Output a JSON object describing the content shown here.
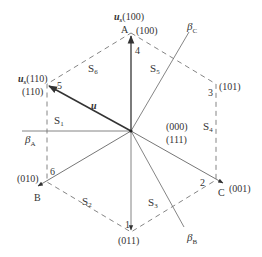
{
  "diagram": {
    "type": "space-vector-hexagon",
    "center": {
      "x": 131,
      "y": 131
    },
    "colors": {
      "line": "#555555",
      "dashed": "#777777",
      "vector": "#333333",
      "text": "#333333"
    },
    "vertices": [
      {
        "id": "v4",
        "number": "4",
        "code": "(100)",
        "axis": "A",
        "vector_label": "u",
        "vector_sub": "s",
        "vector_code": "(100)",
        "x": 131,
        "y": 33
      },
      {
        "id": "v5",
        "number": "5",
        "code": "(110)",
        "vector_label": "u",
        "vector_sub": "s",
        "vector_code": "(110)",
        "x": 47,
        "y": 84
      },
      {
        "id": "v6",
        "number": "6",
        "code": "(010)",
        "axis": "B",
        "x": 47,
        "y": 182
      },
      {
        "id": "v1",
        "number": "1",
        "code": "(011)",
        "x": 131,
        "y": 232
      },
      {
        "id": "v2",
        "number": "2",
        "code": "(001)",
        "axis": "C",
        "x": 216,
        "y": 180
      },
      {
        "id": "v3",
        "number": "3",
        "code": "(101)",
        "x": 216,
        "y": 84
      }
    ],
    "sectors": [
      {
        "label": "S",
        "sub": "1"
      },
      {
        "label": "S",
        "sub": "2"
      },
      {
        "label": "S",
        "sub": "3"
      },
      {
        "label": "S",
        "sub": "4"
      },
      {
        "label": "S",
        "sub": "5"
      },
      {
        "label": "S",
        "sub": "6"
      }
    ],
    "zero_vectors": [
      "(000)",
      "(111)"
    ],
    "beta_axes": [
      {
        "name": "β",
        "sub": "A"
      },
      {
        "name": "β",
        "sub": "B"
      },
      {
        "name": "β",
        "sub": "C"
      }
    ],
    "reference_vector": {
      "label": "u"
    }
  }
}
